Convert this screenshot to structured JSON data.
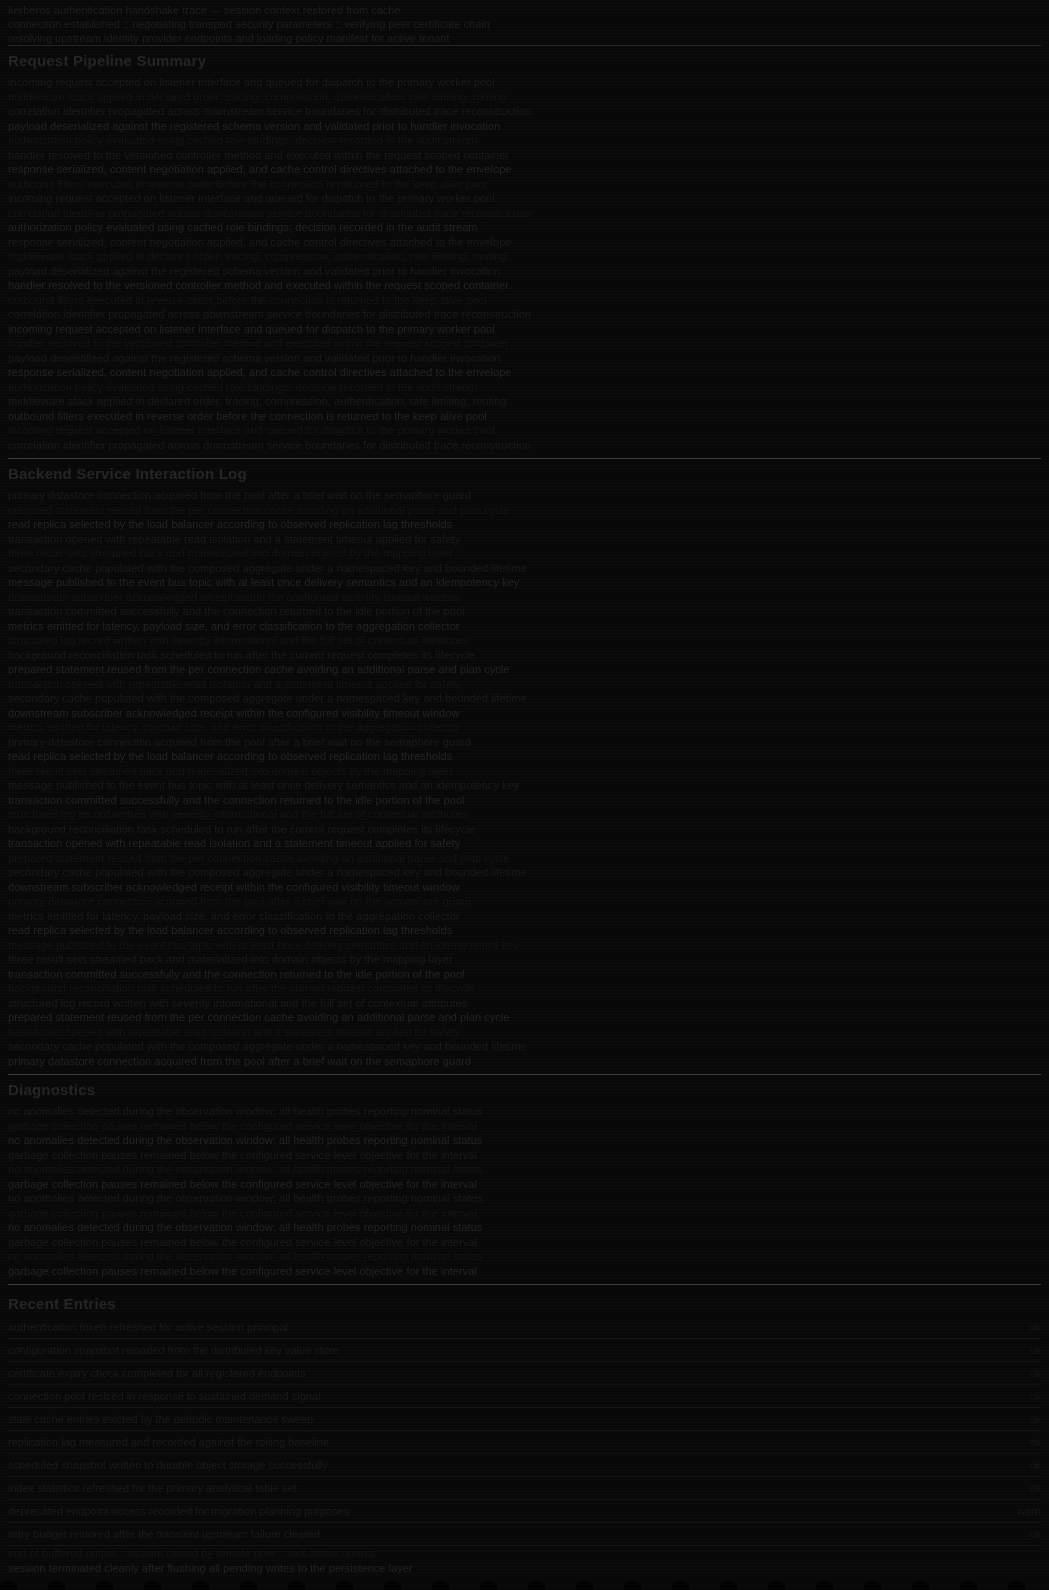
{
  "document": {
    "background_color": "#080808",
    "divider_color": "#3a3a3a",
    "text_color": "#1a1a1a",
    "heading_color": "#242424"
  },
  "header": {
    "line_1": "kerberos authentication handshake trace — session context restored from cache",
    "line_2": "connection established  ::  negotiating transport security parameters  ::  verifying peer certificate chain",
    "line_3": "resolving upstream identity provider endpoints and loading policy manifest for active tenant"
  },
  "section_one": {
    "heading": "Request Pipeline Summary",
    "paragraphs": [
      "incoming request accepted on listener interface and queued for dispatch to the primary worker pool",
      "middleware stack applied in declared order: tracing, compression, authentication, rate limiting, routing",
      "correlation identifier propagated across downstream service boundaries for distributed trace reconstruction",
      "payload deserialized against the registered schema version and validated prior to handler invocation",
      "authorization policy evaluated using cached role bindings; decision recorded in the audit stream",
      "handler resolved to the versioned controller method and executed within the request scoped container",
      "response serialized, content negotiation applied, and cache control directives attached to the envelope",
      "outbound filters executed in reverse order before the connection is returned to the keep alive pool"
    ]
  },
  "section_two": {
    "heading": "Backend Service Interaction Log",
    "paragraphs": [
      "primary datastore connection acquired from the pool after a brief wait on the semaphore guard",
      "prepared statement reused from the per connection cache avoiding an additional parse and plan cycle",
      "read replica selected by the load balancer according to observed replication lag thresholds",
      "transaction opened with repeatable read isolation and a statement timeout applied for safety",
      "three result sets streamed back and materialized into domain objects by the mapping layer",
      "secondary cache populated with the composed aggregate under a namespaced key and bounded lifetime",
      "message published to the event bus topic with at least once delivery semantics and an idempotency key",
      "downstream subscriber acknowledged receipt within the configured visibility timeout window",
      "transaction committed successfully and the connection returned to the idle portion of the pool",
      "metrics emitted for latency, payload size, and error classification to the aggregation collector",
      "structured log record written with severity informational and the full set of contextual attributes",
      "background reconciliation task scheduled to run after the current request completes its lifecycle"
    ]
  },
  "section_three": {
    "heading": "Diagnostics",
    "paragraphs": [
      "no anomalies detected during the observation window; all health probes reporting nominal status",
      "garbage collection pauses remained below the configured service level objective for the interval"
    ]
  },
  "list_section": {
    "heading": "Recent Entries",
    "items": [
      {
        "main": "authentication token refreshed for active session principal",
        "meta": "ok"
      },
      {
        "main": "configuration snapshot reloaded from the distributed key value store",
        "meta": "ok"
      },
      {
        "main": "certificate expiry check completed for all registered endpoints",
        "meta": "ok"
      },
      {
        "main": "connection pool resized in response to sustained demand signal",
        "meta": "ok"
      },
      {
        "main": "stale cache entries evicted by the periodic maintenance sweep",
        "meta": "ok"
      },
      {
        "main": "replication lag measured and recorded against the rolling baseline",
        "meta": "ok"
      },
      {
        "main": "scheduled snapshot written to durable object storage successfully",
        "meta": "ok"
      },
      {
        "main": "index statistics refreshed for the primary analytical table set",
        "meta": "ok"
      },
      {
        "main": "deprecated endpoint access recorded for migration planning purposes",
        "meta": "warn"
      },
      {
        "main": "retry budget restored after the transient upstream failure cleared",
        "meta": "ok"
      }
    ]
  },
  "footer": {
    "line_1": "end of buffered output  ::  stream closed by remote peer  ::  exit status normal",
    "line_2": "session terminated cleanly after flushing all pending writes to the persistence layer"
  }
}
